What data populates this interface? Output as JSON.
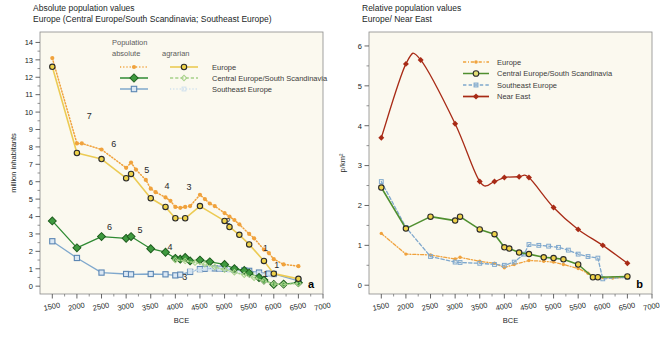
{
  "figure": {
    "panel_a_id": "a",
    "panel_b_id": "b",
    "plot_bg": "#fbf9ef",
    "frame_color": "#8a8a8a"
  },
  "panel_a": {
    "title_line1": "Absolute population values",
    "title_line2": "Europe (Central Europe/South Scandinavia; Southeast Europe)",
    "ylabel": "million inhabitants",
    "xlabel": "BCE",
    "legend": {
      "header": "Population",
      "col1": "absolute",
      "col2": "agrarian",
      "rows": [
        {
          "label": "Europe",
          "color": "#f0a23c"
        },
        {
          "label": "Central Europe/South Scandinavia",
          "color": "#2f8a33"
        },
        {
          "label": "Southeast Europe",
          "color": "#7fa8cd"
        }
      ]
    },
    "annotations": [
      {
        "text": "7",
        "x": 2250,
        "y": 9.6
      },
      {
        "text": "6",
        "x": 2750,
        "y": 8.0
      },
      {
        "text": "5",
        "x": 3420,
        "y": 6.5
      },
      {
        "text": "4",
        "x": 3830,
        "y": 5.6
      },
      {
        "text": "3",
        "x": 4280,
        "y": 5.55
      },
      {
        "text": "2",
        "x": 5070,
        "y": 3.55
      },
      {
        "text": "1",
        "x": 5830,
        "y": 2.0
      },
      {
        "text": "1",
        "x": 6060,
        "y": 1.05
      },
      {
        "text": "6",
        "x": 2660,
        "y": 3.25
      },
      {
        "text": "5",
        "x": 3280,
        "y": 3.05
      },
      {
        "text": "4",
        "x": 3890,
        "y": 2.1
      },
      {
        "text": "3",
        "x": 4190,
        "y": 0.35
      },
      {
        "text": "1",
        "x": 5830,
        "y": 0.55
      }
    ]
  },
  "panel_b": {
    "title_line1": "Relative population values",
    "title_line2": "Europe/ Near East",
    "ylabel": "p/km²",
    "xlabel": "BCE",
    "legend": {
      "rows": [
        {
          "label": "Europe",
          "color": "#f0a23c"
        },
        {
          "label": "Central Europe/South Scandinavia",
          "color": "#4f8f2f"
        },
        {
          "label": "Southeast Europe",
          "color": "#7fa8cd"
        },
        {
          "label": "Near East",
          "color": "#a82b16"
        }
      ]
    }
  },
  "chart_data": [
    {
      "type": "line",
      "panel": "a",
      "title": "Absolute population values — Europe (Central Europe/South Scandinavia; Southeast Europe)",
      "xlabel": "BCE",
      "ylabel": "million inhabitants",
      "xlim": [
        1250,
        7000
      ],
      "ylim": [
        -0.45,
        14.6
      ],
      "xticks": [
        1500,
        2000,
        2500,
        3000,
        3500,
        4000,
        4500,
        5000,
        5500,
        6000,
        6500,
        7000
      ],
      "yticks": [
        0,
        1,
        2,
        3,
        4,
        5,
        6,
        7,
        8,
        9,
        10,
        11,
        12,
        13,
        14
      ],
      "x_axis_reversed_time": true,
      "grid": false,
      "legend_position": "top-center",
      "series": [
        {
          "name": "Europe absolute",
          "color": "#f0a23c",
          "style": "dotted-line-filled-circle",
          "x": [
            1500,
            2000,
            2100,
            2500,
            3000,
            3100,
            3200,
            3400,
            3500,
            3600,
            3800,
            3900,
            4000,
            4100,
            4200,
            4300,
            4500,
            4600,
            4700,
            4800,
            5000,
            5100,
            5200,
            5300,
            5500,
            5600,
            5800,
            5900,
            6000,
            6200,
            6500
          ],
          "y": [
            13.1,
            8.2,
            8.2,
            7.85,
            6.8,
            7.1,
            6.7,
            6.1,
            5.6,
            5.4,
            5.1,
            4.9,
            4.55,
            4.5,
            4.55,
            4.6,
            5.25,
            5.0,
            4.75,
            4.6,
            4.2,
            4.0,
            3.8,
            3.55,
            3.0,
            2.75,
            2.1,
            1.9,
            1.55,
            1.25,
            1.15
          ]
        },
        {
          "name": "Europe agrarian",
          "color": "#eccb54",
          "marker_color": "#2b2b2b",
          "style": "solid-line-ring",
          "x": [
            1500,
            2000,
            2500,
            3000,
            3100,
            3500,
            3800,
            4000,
            4200,
            4500,
            5000,
            5100,
            5300,
            5500,
            5800,
            6000,
            6500
          ],
          "y": [
            12.6,
            7.65,
            7.3,
            6.2,
            6.45,
            5.05,
            4.55,
            3.9,
            3.9,
            4.6,
            3.75,
            3.4,
            2.95,
            2.4,
            1.45,
            0.72,
            0.42
          ]
        },
        {
          "name": "Central Europe/South Scandinavia absolute",
          "color": "#2f8a33",
          "style": "solid-line-diamond",
          "x": [
            1500,
            2000,
            2500,
            3000,
            3100,
            3500,
            3800,
            4000,
            4100,
            4200,
            4300,
            4500,
            4700,
            5000,
            5200,
            5400,
            5500,
            5700,
            5800,
            6000,
            6200,
            6500
          ],
          "y": [
            3.75,
            2.2,
            2.85,
            2.75,
            2.85,
            2.15,
            1.95,
            1.6,
            1.55,
            1.65,
            1.45,
            1.5,
            1.4,
            1.25,
            1.0,
            0.9,
            0.75,
            0.5,
            0.35,
            0.1,
            0.12,
            0.2
          ]
        },
        {
          "name": "Central Europe/South Scandinavia agrarian",
          "color": "#a7d18a",
          "style": "dotted-line-small-diamond",
          "x": [
            4000,
            4200,
            4400,
            4600,
            4800,
            5000,
            5200,
            5400,
            5600,
            5800,
            6000,
            6200,
            6500
          ],
          "y": [
            1.5,
            1.45,
            1.35,
            1.25,
            1.1,
            0.95,
            0.8,
            0.65,
            0.48,
            0.3,
            0.12,
            0.1,
            0.15
          ]
        },
        {
          "name": "Southeast Europe absolute",
          "color": "#7fa8cd",
          "style": "solid-line-square",
          "x": [
            1500,
            2000,
            2500,
            3000,
            3100,
            3500,
            3800,
            4000,
            4100,
            4300,
            4500,
            4600,
            4800,
            4900,
            5000,
            5200,
            5400,
            5500,
            5700,
            5900,
            6000,
            6500
          ],
          "y": [
            2.58,
            1.62,
            0.78,
            0.7,
            0.68,
            0.7,
            0.68,
            0.62,
            0.66,
            0.82,
            0.98,
            1.0,
            1.02,
            1.0,
            1.0,
            0.95,
            0.9,
            0.88,
            0.78,
            0.72,
            0.7,
            0.3
          ]
        },
        {
          "name": "Southeast Europe agrarian",
          "color": "#cfe0ee",
          "style": "dotted-line-small-square",
          "x": [
            4300,
            4500,
            4700,
            4900,
            5100,
            5300,
            5500,
            5700,
            5900,
            6000
          ],
          "y": [
            0.85,
            0.95,
            0.98,
            0.98,
            0.92,
            0.86,
            0.8,
            0.72,
            0.68,
            0.65
          ]
        }
      ]
    },
    {
      "type": "line",
      "panel": "b",
      "title": "Relative population values — Europe/ Near East",
      "xlabel": "BCE",
      "ylabel": "p/km²",
      "xlim": [
        1250,
        7000
      ],
      "ylim": [
        -0.22,
        6.35
      ],
      "xticks": [
        1500,
        2000,
        2500,
        3000,
        3500,
        4000,
        4500,
        5000,
        5500,
        6000,
        6500,
        7000
      ],
      "yticks": [
        0,
        1,
        2,
        3,
        4,
        5,
        6
      ],
      "x_axis_reversed_time": true,
      "grid": false,
      "legend_position": "top-right",
      "series": [
        {
          "name": "Near East",
          "color": "#a82b16",
          "style": "solid-line-filled-diamond",
          "x": [
            1500,
            2000,
            2300,
            3000,
            3500,
            3800,
            4000,
            4300,
            4500,
            5000,
            5500,
            6000,
            6500
          ],
          "y": [
            3.7,
            5.55,
            5.65,
            4.05,
            2.6,
            2.6,
            2.7,
            2.72,
            2.7,
            1.95,
            1.4,
            1.0,
            0.55
          ]
        },
        {
          "name": "Central Europe/South Scandinavia",
          "color": "#4f8f2f",
          "marker_color": "#2b2b2b",
          "style": "solid-line-ring",
          "x": [
            1500,
            2000,
            2500,
            3000,
            3100,
            3500,
            3800,
            4000,
            4100,
            4300,
            4500,
            4800,
            5000,
            5200,
            5500,
            5800,
            5900,
            6500
          ],
          "y": [
            2.45,
            1.42,
            1.72,
            1.62,
            1.72,
            1.4,
            1.28,
            0.95,
            0.92,
            0.82,
            0.78,
            0.7,
            0.68,
            0.65,
            0.52,
            0.2,
            0.2,
            0.22
          ]
        },
        {
          "name": "Southeast Europe",
          "color": "#7fa8cd",
          "style": "dashed-line-small-square",
          "x": [
            1500,
            2000,
            2500,
            3000,
            3100,
            3500,
            3800,
            4000,
            4200,
            4400,
            4500,
            4700,
            4900,
            5100,
            5300,
            5500,
            5700,
            5900,
            6000,
            6500
          ],
          "y": [
            2.6,
            1.45,
            0.72,
            0.58,
            0.57,
            0.55,
            0.52,
            0.5,
            0.58,
            0.78,
            1.02,
            1.0,
            0.98,
            0.95,
            0.88,
            0.78,
            0.72,
            0.68,
            0.16,
            0.2
          ]
        },
        {
          "name": "Europe",
          "color": "#f0a23c",
          "style": "dash-dot-line-small-circle",
          "x": [
            1500,
            2000,
            2500,
            3000,
            3100,
            3500,
            3800,
            4000,
            4200,
            4500,
            4800,
            5000,
            5200,
            5500,
            5700,
            5900,
            6000,
            6200,
            6500
          ],
          "y": [
            1.3,
            0.78,
            0.76,
            0.66,
            0.7,
            0.6,
            0.55,
            0.44,
            0.52,
            0.62,
            0.6,
            0.58,
            0.52,
            0.42,
            0.3,
            0.2,
            0.19,
            0.18,
            0.2
          ]
        }
      ]
    }
  ]
}
